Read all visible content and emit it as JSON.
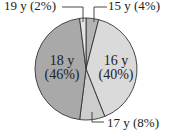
{
  "chart_data": {
    "type": "pie",
    "title": "",
    "categories": [
      "15 y",
      "16 y",
      "17 y",
      "18 y",
      "19 y"
    ],
    "values": [
      4,
      40,
      8,
      46,
      2
    ],
    "unit": "%",
    "start_angle_deg": 0,
    "direction": "clockwise",
    "colors": [
      "#b4b4b4",
      "#dadada",
      "#cdcdcd",
      "#a9a9a9",
      "#e4e4e4"
    ],
    "labels": [
      {
        "name": "15 y",
        "pct": "(4%)",
        "text": "15 y (4%)",
        "placement": "outside-callout"
      },
      {
        "name": "16 y",
        "pct": "(40%)",
        "text": "16 y (40%)",
        "placement": "inside"
      },
      {
        "name": "17 y",
        "pct": "(8%)",
        "text": "17 y (8%)",
        "placement": "outside-callout"
      },
      {
        "name": "18 y",
        "pct": "(46%)",
        "text": "18 y (46%)",
        "placement": "inside"
      },
      {
        "name": "19 y",
        "pct": "(2%)",
        "text": "19 y (2%)",
        "placement": "outside-callout"
      }
    ],
    "legend": "none"
  },
  "geometry": {
    "cx": 86,
    "cy": 69,
    "r": 51
  },
  "style": {
    "stroke": "#333333"
  }
}
